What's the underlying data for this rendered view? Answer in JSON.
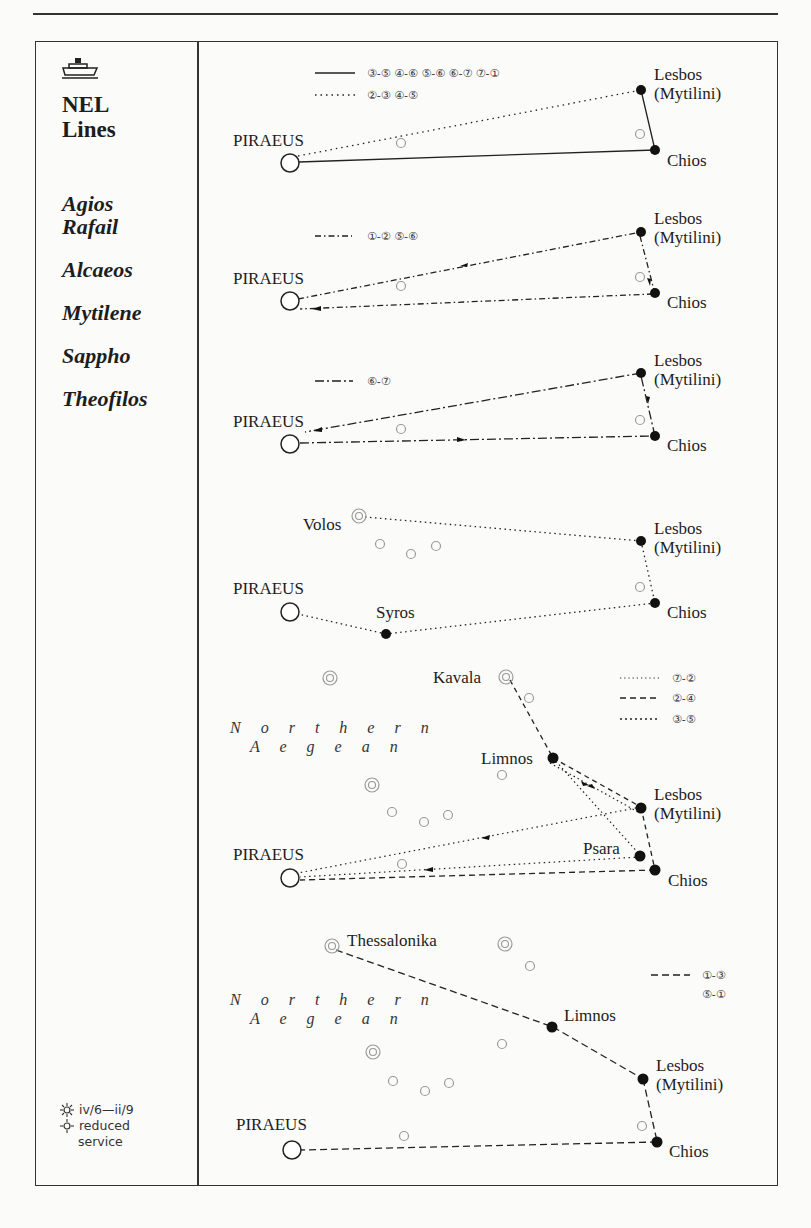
{
  "operator": {
    "line1": "NEL",
    "line2": "Lines",
    "icon": "ferry-icon"
  },
  "vessels": [
    "Agios",
    "Rafail",
    "Alcaeos",
    "Mytilene",
    "Sappho",
    "Theofilos"
  ],
  "season_legend": {
    "summer_icon": "sun-icon",
    "summer_text": "iv/6—ii/9",
    "reduced_icon": "half-sun-icon",
    "reduced_text_1": "reduced",
    "reduced_text_2": "service"
  },
  "port_labels": {
    "piraeus": "PIRAEUS",
    "lesbos": "Lesbos",
    "mytilini": "(Mytilini)",
    "chios": "Chios",
    "volos": "Volos",
    "syros": "Syros",
    "kavala": "Kavala",
    "limnos": "Limnos",
    "psara": "Psara",
    "thessalonika": "Thessalonika",
    "sea_1": "N o r t h e r n",
    "sea_2": "A e g e a n"
  },
  "panels": [
    {
      "id": "panel-1",
      "legend": [
        {
          "style": "solid",
          "days": "③-⑤  ④-⑥  ⑤-⑥  ⑥-⑦  ⑦-①"
        },
        {
          "style": "dotted",
          "days": "②-③  ④-⑤"
        }
      ]
    },
    {
      "id": "panel-2",
      "legend": [
        {
          "style": "dash-dot",
          "days": "①-②  ⑤-⑥"
        }
      ]
    },
    {
      "id": "panel-3",
      "legend": [
        {
          "style": "long-dash-dot",
          "days": "⑥-⑦"
        }
      ]
    },
    {
      "id": "panel-4",
      "legend": []
    },
    {
      "id": "panel-5",
      "legend": [
        {
          "style": "dotted",
          "days": "⑦-②"
        },
        {
          "style": "dashed",
          "days": "②-④"
        },
        {
          "style": "dotted",
          "days": "③-⑤"
        }
      ]
    },
    {
      "id": "panel-6",
      "legend": [
        {
          "style": "dashed",
          "days": "①-③"
        },
        {
          "style": "none",
          "days": "⑤-①"
        }
      ]
    }
  ],
  "colors": {
    "ink": "#1d1d1d",
    "grey_port": "#9a9a9a",
    "paper": "#fbfbfa"
  }
}
